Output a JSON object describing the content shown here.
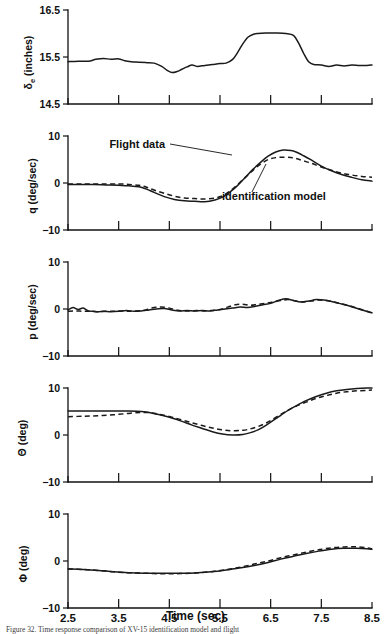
{
  "figure": {
    "xaxis_title": "Time (sec)",
    "caption": "Figure 32.    Time response comparison of XV-15 identification model and flight",
    "annotations": {
      "flight_data": "Flight data",
      "identification_model": "identification model"
    }
  },
  "chart_data": [
    {
      "type": "line",
      "panel_index": 0,
      "ylabel": "δe (inches)",
      "ylabel_main": "δ",
      "ylabel_sub": "e",
      "ylabel_unit": " (inches)",
      "xlabel": "Time (sec)",
      "title": "",
      "xlim": [
        2.5,
        8.5
      ],
      "ylim": [
        14.5,
        16.5
      ],
      "yticks": [
        14.5,
        15.5,
        16.5
      ],
      "ytick_labels": [
        "14.5",
        "15.5",
        "16.5"
      ],
      "xticks": [
        2.5,
        3.5,
        4.5,
        5.5,
        6.5,
        7.5,
        8.5
      ],
      "grid": false,
      "legend": "none",
      "series": [
        {
          "name": "Flight data",
          "style": "solid",
          "x": [
            2.5,
            2.7,
            2.9,
            3.05,
            3.2,
            3.35,
            3.5,
            3.62,
            3.75,
            3.9,
            4.05,
            4.2,
            4.35,
            4.45,
            4.55,
            4.65,
            4.75,
            4.85,
            4.95,
            5.05,
            5.2,
            5.35,
            5.5,
            5.62,
            5.75,
            5.85,
            5.95,
            6.05,
            6.15,
            6.25,
            6.4,
            6.6,
            6.8,
            6.95,
            7.05,
            7.15,
            7.25,
            7.35,
            7.5,
            7.65,
            7.8,
            7.95,
            8.1,
            8.25,
            8.4,
            8.5
          ],
          "y": [
            15.4,
            15.41,
            15.41,
            15.45,
            15.47,
            15.45,
            15.46,
            15.42,
            15.4,
            15.39,
            15.38,
            15.37,
            15.3,
            15.22,
            15.17,
            15.19,
            15.24,
            15.29,
            15.33,
            15.3,
            15.32,
            15.34,
            15.36,
            15.37,
            15.45,
            15.6,
            15.78,
            15.92,
            15.98,
            16.0,
            16.01,
            16.01,
            16.0,
            15.96,
            15.8,
            15.58,
            15.4,
            15.34,
            15.33,
            15.3,
            15.33,
            15.31,
            15.33,
            15.32,
            15.32,
            15.33
          ]
        }
      ]
    },
    {
      "type": "line",
      "panel_index": 1,
      "ylabel": "q (deg/sec)",
      "xlabel": "Time (sec)",
      "title": "",
      "xlim": [
        2.5,
        8.5
      ],
      "ylim": [
        -10,
        10
      ],
      "yticks": [
        -10,
        0,
        10
      ],
      "ytick_labels": [
        "−10",
        "0",
        "10"
      ],
      "xticks": [
        2.5,
        3.5,
        4.5,
        5.5,
        6.5,
        7.5,
        8.5
      ],
      "grid": false,
      "legend": "annotated",
      "series": [
        {
          "name": "Flight data",
          "style": "solid",
          "x": [
            2.5,
            2.75,
            3.0,
            3.25,
            3.5,
            3.7,
            3.9,
            4.05,
            4.2,
            4.4,
            4.6,
            4.8,
            5.0,
            5.2,
            5.4,
            5.55,
            5.7,
            5.85,
            6.0,
            6.15,
            6.3,
            6.45,
            6.6,
            6.75,
            6.9,
            7.0,
            7.15,
            7.3,
            7.5,
            7.7,
            7.9,
            8.1,
            8.3,
            8.5
          ],
          "y": [
            -0.3,
            -0.3,
            -0.3,
            -0.4,
            -0.5,
            -0.6,
            -0.8,
            -1.3,
            -2.0,
            -2.9,
            -3.5,
            -3.8,
            -3.9,
            -4.0,
            -3.6,
            -3.0,
            -1.9,
            -0.5,
            1.2,
            2.9,
            4.4,
            5.7,
            6.6,
            7.0,
            6.9,
            6.6,
            5.8,
            4.9,
            3.6,
            2.6,
            1.8,
            1.2,
            0.7,
            0.4
          ]
        },
        {
          "name": "identification model",
          "style": "dashed",
          "x": [
            2.5,
            2.75,
            3.0,
            3.25,
            3.5,
            3.7,
            3.9,
            4.05,
            4.2,
            4.4,
            4.6,
            4.8,
            5.0,
            5.2,
            5.4,
            5.55,
            5.7,
            5.85,
            6.0,
            6.15,
            6.3,
            6.45,
            6.6,
            6.75,
            6.9,
            7.0,
            7.15,
            7.3,
            7.5,
            7.7,
            7.9,
            8.1,
            8.3,
            8.5
          ],
          "y": [
            -0.2,
            -0.2,
            -0.2,
            -0.2,
            -0.2,
            -0.3,
            -0.5,
            -0.9,
            -1.5,
            -2.2,
            -2.8,
            -3.2,
            -3.3,
            -3.4,
            -3.2,
            -2.7,
            -1.7,
            -0.3,
            1.2,
            2.7,
            4.0,
            5.0,
            5.4,
            5.5,
            5.4,
            5.2,
            4.7,
            4.2,
            3.4,
            2.7,
            2.1,
            1.7,
            1.4,
            1.2
          ]
        }
      ]
    },
    {
      "type": "line",
      "panel_index": 2,
      "ylabel": "p (deg/sec)",
      "xlabel": "Time (sec)",
      "title": "",
      "xlim": [
        2.5,
        8.5
      ],
      "ylim": [
        -10,
        10
      ],
      "yticks": [
        -10,
        0,
        10
      ],
      "ytick_labels": [
        "−10",
        "0",
        "10"
      ],
      "xticks": [
        2.5,
        3.5,
        4.5,
        5.5,
        6.5,
        7.5,
        8.5
      ],
      "grid": false,
      "legend": "none",
      "series": [
        {
          "name": "Flight data",
          "style": "solid",
          "x": [
            2.5,
            2.6,
            2.7,
            2.8,
            2.9,
            3.0,
            3.1,
            3.2,
            3.35,
            3.5,
            3.65,
            3.8,
            3.95,
            4.1,
            4.25,
            4.4,
            4.55,
            4.7,
            4.85,
            5.0,
            5.15,
            5.3,
            5.45,
            5.6,
            5.75,
            5.9,
            6.05,
            6.2,
            6.35,
            6.5,
            6.65,
            6.8,
            6.95,
            7.1,
            7.25,
            7.4,
            7.55,
            7.7,
            7.85,
            8.0,
            8.15,
            8.3,
            8.45,
            8.5
          ],
          "y": [
            -0.2,
            0.3,
            -0.1,
            0.2,
            -0.4,
            -0.5,
            -0.6,
            -0.5,
            -0.6,
            -0.5,
            -0.3,
            -0.5,
            -0.4,
            -0.2,
            0.0,
            0.1,
            -0.2,
            -0.4,
            -0.3,
            -0.4,
            -0.3,
            -0.4,
            -0.2,
            0.0,
            0.2,
            0.4,
            0.3,
            0.6,
            0.9,
            1.2,
            1.8,
            2.2,
            1.8,
            1.5,
            1.7,
            2.0,
            1.9,
            1.6,
            1.2,
            0.8,
            0.3,
            -0.2,
            -0.7,
            -0.8
          ]
        },
        {
          "name": "identification model",
          "style": "dashed",
          "x": [
            2.5,
            2.65,
            2.8,
            2.95,
            3.1,
            3.25,
            3.4,
            3.55,
            3.7,
            3.85,
            4.0,
            4.15,
            4.3,
            4.45,
            4.6,
            4.75,
            4.9,
            5.05,
            5.2,
            5.35,
            5.5,
            5.65,
            5.8,
            5.95,
            6.1,
            6.25,
            6.4,
            6.55,
            6.7,
            6.85,
            7.0,
            7.15,
            7.3,
            7.45,
            7.6,
            7.75,
            7.9,
            8.05,
            8.2,
            8.35,
            8.5
          ],
          "y": [
            -0.5,
            -0.4,
            -0.5,
            -0.5,
            -0.6,
            -0.5,
            -0.5,
            -0.4,
            -0.5,
            -0.4,
            -0.3,
            0.2,
            0.4,
            0.3,
            -0.1,
            -0.4,
            -0.4,
            -0.3,
            -0.4,
            -0.3,
            -0.1,
            0.4,
            0.9,
            1.0,
            0.8,
            1.0,
            1.2,
            1.5,
            1.8,
            2.0,
            1.7,
            1.5,
            1.7,
            1.9,
            1.8,
            1.5,
            1.1,
            0.7,
            0.2,
            -0.3,
            -0.8
          ]
        }
      ]
    },
    {
      "type": "line",
      "panel_index": 3,
      "ylabel": "Θ (deg)",
      "xlabel": "Time (sec)",
      "title": "",
      "xlim": [
        2.5,
        8.5
      ],
      "ylim": [
        -10,
        10
      ],
      "yticks": [
        -10,
        0,
        10
      ],
      "ytick_labels": [
        "−10",
        "0",
        "10"
      ],
      "xticks": [
        2.5,
        3.5,
        4.5,
        5.5,
        6.5,
        7.5,
        8.5
      ],
      "grid": false,
      "legend": "none",
      "series": [
        {
          "name": "Flight data",
          "style": "solid",
          "x": [
            2.5,
            2.8,
            3.1,
            3.4,
            3.7,
            3.95,
            4.15,
            4.35,
            4.55,
            4.75,
            4.95,
            5.15,
            5.35,
            5.55,
            5.75,
            5.95,
            6.1,
            6.25,
            6.4,
            6.55,
            6.7,
            6.85,
            7.0,
            7.2,
            7.4,
            7.6,
            7.8,
            8.0,
            8.2,
            8.4,
            8.5
          ],
          "y": [
            5.1,
            5.1,
            5.1,
            5.1,
            5.1,
            5.0,
            4.7,
            4.2,
            3.6,
            2.9,
            2.1,
            1.4,
            0.7,
            0.2,
            0.0,
            0.1,
            0.5,
            1.1,
            2.0,
            3.1,
            4.2,
            5.3,
            6.2,
            7.3,
            8.2,
            8.9,
            9.4,
            9.7,
            9.9,
            10.0,
            10.0
          ]
        },
        {
          "name": "identification model",
          "style": "dashed",
          "x": [
            2.5,
            2.8,
            3.1,
            3.4,
            3.7,
            3.95,
            4.15,
            4.35,
            4.55,
            4.75,
            4.95,
            5.15,
            5.35,
            5.55,
            5.75,
            5.95,
            6.1,
            6.25,
            6.4,
            6.55,
            6.7,
            6.85,
            7.0,
            7.2,
            7.4,
            7.6,
            7.8,
            8.0,
            8.2,
            8.4,
            8.5
          ],
          "y": [
            3.9,
            4.0,
            4.1,
            4.3,
            4.6,
            4.8,
            4.7,
            4.3,
            3.8,
            3.2,
            2.6,
            2.0,
            1.5,
            1.1,
            0.9,
            1.0,
            1.3,
            1.8,
            2.5,
            3.4,
            4.4,
            5.3,
            6.1,
            7.0,
            7.8,
            8.4,
            8.9,
            9.2,
            9.4,
            9.5,
            9.6
          ]
        }
      ]
    },
    {
      "type": "line",
      "panel_index": 4,
      "ylabel": "Φ (deg)",
      "xlabel": "Time (sec)",
      "title": "",
      "xlim": [
        2.5,
        8.5
      ],
      "ylim": [
        -10,
        10
      ],
      "yticks": [
        -10,
        0,
        10
      ],
      "ytick_labels": [
        "−10",
        "0",
        "10"
      ],
      "xticks": [
        2.5,
        3.5,
        4.5,
        5.5,
        6.5,
        7.5,
        8.5
      ],
      "grid": false,
      "legend": "none",
      "series": [
        {
          "name": "Flight data",
          "style": "solid",
          "x": [
            2.5,
            2.8,
            3.1,
            3.4,
            3.7,
            4.0,
            4.3,
            4.6,
            4.9,
            5.2,
            5.45,
            5.7,
            5.95,
            6.2,
            6.45,
            6.7,
            6.95,
            7.2,
            7.45,
            7.7,
            7.95,
            8.2,
            8.4,
            8.5
          ],
          "y": [
            -1.7,
            -1.8,
            -2.0,
            -2.3,
            -2.5,
            -2.6,
            -2.6,
            -2.6,
            -2.6,
            -2.4,
            -2.2,
            -1.8,
            -1.4,
            -0.9,
            -0.3,
            0.4,
            1.0,
            1.6,
            2.1,
            2.5,
            2.7,
            2.7,
            2.6,
            2.5
          ]
        },
        {
          "name": "identification model",
          "style": "dashed",
          "x": [
            2.5,
            2.8,
            3.1,
            3.4,
            3.7,
            4.0,
            4.3,
            4.6,
            4.9,
            5.2,
            5.45,
            5.7,
            5.95,
            6.2,
            6.45,
            6.7,
            6.95,
            7.2,
            7.45,
            7.7,
            7.95,
            8.2,
            8.4,
            8.5
          ],
          "y": [
            -1.7,
            -1.8,
            -2.0,
            -2.3,
            -2.5,
            -2.6,
            -2.7,
            -2.7,
            -2.6,
            -2.4,
            -2.1,
            -1.7,
            -1.2,
            -0.6,
            0.0,
            0.7,
            1.3,
            1.9,
            2.4,
            2.8,
            3.0,
            3.0,
            2.8,
            2.6
          ]
        }
      ]
    }
  ]
}
